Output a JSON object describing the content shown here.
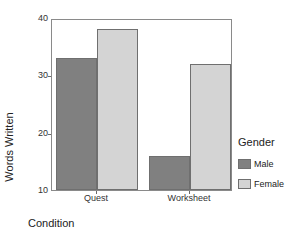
{
  "chart_data": {
    "type": "bar",
    "title": "",
    "xlabel": "Condition",
    "ylabel": "Words Written",
    "categories": [
      "Quest",
      "Worksheet"
    ],
    "series": [
      {
        "name": "Male",
        "values": [
          33,
          16
        ],
        "color": "#808080"
      },
      {
        "name": "Female",
        "values": [
          38,
          32
        ],
        "color": "#d4d4d4"
      }
    ],
    "ylim": [
      10,
      40
    ],
    "yticks": [
      10,
      20,
      30,
      40
    ],
    "ytick_labels": [
      "10",
      "20",
      "30",
      "40"
    ],
    "grid": false,
    "legend": {
      "title": "Gender",
      "position": "right",
      "entries": [
        {
          "label": "Male",
          "color": "#808080"
        },
        {
          "label": "Female",
          "color": "#d4d4d4"
        }
      ]
    },
    "axis_colors": {
      "frame": "#8a8a8a",
      "bar_outline": "#6f6f6f"
    }
  }
}
